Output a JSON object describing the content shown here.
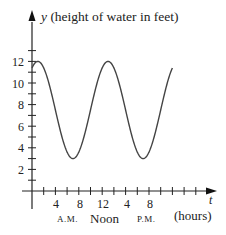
{
  "chart_data": {
    "type": "line",
    "title": "",
    "ylabel": "y (height of water in feet)",
    "xlabel": "t (hours)",
    "y_axis_var": "y",
    "y_axis_desc": "(height of water in feet)",
    "x_axis_var": "t",
    "x_axis_desc": "(hours)",
    "xlim": [
      0,
      26
    ],
    "ylim": [
      0,
      14
    ],
    "grid": false,
    "legend": null,
    "y_ticks": [
      2,
      4,
      6,
      8,
      10,
      12
    ],
    "x_tick_labels": [
      "4",
      "8",
      "12",
      "4",
      "8"
    ],
    "x_tick_values": [
      4,
      8,
      12,
      16,
      20
    ],
    "x_period_labels": [
      "A.M.",
      "Noon",
      "P.M."
    ],
    "series": [
      {
        "name": "height of water",
        "function": "y = 7.5 + 4.5*cos(pi*(t-1)/6)",
        "x": [
          0,
          1,
          2,
          3,
          4,
          5,
          6,
          7,
          8,
          9,
          10,
          11,
          12,
          13,
          14,
          15,
          16,
          17,
          18,
          19,
          20,
          21,
          22,
          23,
          24
        ],
        "values": [
          11.4,
          12,
          11.4,
          9.75,
          7.5,
          5.25,
          3.6,
          3,
          3.6,
          5.25,
          7.5,
          9.75,
          11.4,
          12,
          11.4,
          9.75,
          7.5,
          5.25,
          3.6,
          3,
          3.6,
          5.25,
          7.5,
          9.75,
          11.4
        ]
      }
    ]
  },
  "labels": {
    "y_var": "y",
    "y_desc": "(height of water in feet)",
    "t_var": "t",
    "t_desc": "(hours)",
    "am": "A.M.",
    "noon": "Noon",
    "pm": "P.M.",
    "y12": "12",
    "y10": "10",
    "y8": "8",
    "y6": "6",
    "y4": "4",
    "y2": "2",
    "x4": "4",
    "x8": "8",
    "x12": "12",
    "x16": "4",
    "x20": "8"
  }
}
